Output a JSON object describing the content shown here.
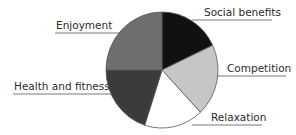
{
  "chart_data": {
    "type": "pie",
    "title": "",
    "start_angle_deg_clockwise_from_top": 0,
    "slices": [
      {
        "label": "Social benefits",
        "value": 18,
        "color": "#111111"
      },
      {
        "label": "Competition",
        "value": 20,
        "color": "#c6c6c6"
      },
      {
        "label": "Relaxation",
        "value": 17,
        "color": "#ffffff"
      },
      {
        "label": "Health and fitness",
        "value": 20,
        "color": "#3b3b3b"
      },
      {
        "label": "Enjoyment",
        "value": 25,
        "color": "#6e6e6e"
      }
    ],
    "value_units": "percent (estimated from slice angles, unlabeled)",
    "legend": "none",
    "labels": "external with leader lines"
  }
}
